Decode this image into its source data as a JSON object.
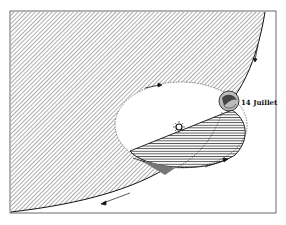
{
  "diagram": {
    "labels": {
      "earth_date": "14 Juillet"
    },
    "elements": {
      "shadow_region": "large hatched region bounded by a curve",
      "orbit": "dotted ellipse with sun near center",
      "sun": "sun symbol",
      "earth": "earth globe at orbit edge",
      "lower_disc": "horizontally hatched half-ellipse"
    },
    "colors": {
      "ink": "#1a1a1a",
      "paper": "#ffffff"
    }
  }
}
